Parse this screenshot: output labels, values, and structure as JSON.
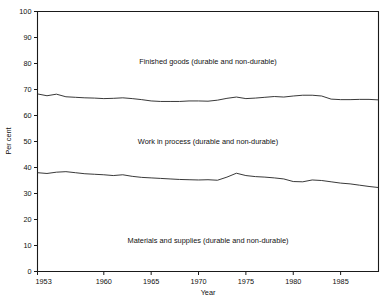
{
  "chart_data": {
    "type": "line",
    "title": "",
    "subtitle": "",
    "xlabel": "Year",
    "ylabel": "Per cent",
    "xlim": [
      1953,
      1989
    ],
    "ylim": [
      0,
      100
    ],
    "grid": false,
    "legend_position": "inline-annotations",
    "x_ticks": [
      1953,
      1960,
      1965,
      1970,
      1975,
      1980,
      1985
    ],
    "x_tick_labels": [
      "1953",
      "1960",
      "1965",
      "1970",
      "1975",
      "1980",
      "1985"
    ],
    "y_ticks": [
      0,
      10,
      20,
      30,
      40,
      50,
      60,
      70,
      80,
      90,
      100
    ],
    "y_tick_labels": [
      "0",
      "10",
      "20",
      "30",
      "40",
      "50",
      "60",
      "70",
      "80",
      "90",
      "100"
    ],
    "annotations": [
      {
        "text": "Finished goods (durable and non-durable)",
        "x": 1971,
        "y": 80
      },
      {
        "text": "Work in process (durable and non-durable)",
        "x": 1971,
        "y": 49
      },
      {
        "text": "Materials and supplies (durable and non-durable)",
        "x": 1971,
        "y": 11
      }
    ],
    "x": [
      1953,
      1954,
      1955,
      1956,
      1957,
      1958,
      1959,
      1960,
      1961,
      1962,
      1963,
      1964,
      1965,
      1966,
      1967,
      1968,
      1969,
      1970,
      1971,
      1972,
      1973,
      1974,
      1975,
      1976,
      1977,
      1978,
      1979,
      1980,
      1981,
      1982,
      1983,
      1984,
      1985,
      1986,
      1987,
      1988,
      1989
    ],
    "series": [
      {
        "name": "Upper boundary: materials and supplies + work in process (cumulative)",
        "note": "Separates Finished goods band from Work in process band",
        "values": [
          68.3,
          67.6,
          68.2,
          67.2,
          67.0,
          66.8,
          66.7,
          66.5,
          66.6,
          66.8,
          66.5,
          66.1,
          65.6,
          65.4,
          65.4,
          65.4,
          65.6,
          65.6,
          65.5,
          65.9,
          66.6,
          67.1,
          66.5,
          66.7,
          67.0,
          67.3,
          67.1,
          67.5,
          67.8,
          67.8,
          67.5,
          66.3,
          66.1,
          66.1,
          66.2,
          66.2,
          66.0
        ]
      },
      {
        "name": "Upper boundary: materials and supplies (cumulative)",
        "note": "Separates Work in process band from Materials and supplies band",
        "values": [
          38.0,
          37.7,
          38.2,
          38.4,
          38.0,
          37.6,
          37.4,
          37.2,
          36.9,
          37.2,
          36.6,
          36.2,
          36.0,
          35.8,
          35.6,
          35.4,
          35.3,
          35.2,
          35.3,
          35.1,
          36.3,
          37.8,
          36.9,
          36.5,
          36.3,
          36.0,
          35.6,
          34.6,
          34.5,
          35.2,
          35.0,
          34.5,
          34.0,
          33.7,
          33.2,
          32.7,
          32.3
        ]
      }
    ],
    "bands": [
      {
        "name": "Finished goods (durable and non-durable)",
        "approx_range_pct": [
          66,
          100
        ]
      },
      {
        "name": "Work in process (durable and non-durable)",
        "approx_range_pct": [
          35,
          66
        ]
      },
      {
        "name": "Materials and supplies (durable and non-durable)",
        "approx_range_pct": [
          0,
          35
        ]
      }
    ],
    "colors": {
      "line": "#222222",
      "axis": "#1a1a1a",
      "background": "#ffffff"
    }
  }
}
